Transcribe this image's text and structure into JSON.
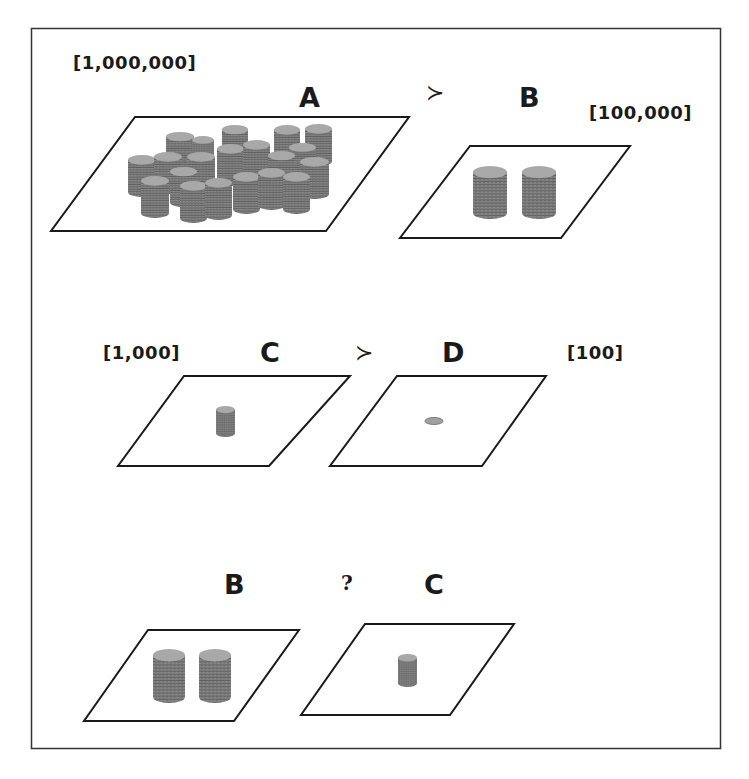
{
  "figure": {
    "frame": {
      "x": 31,
      "y": 28,
      "width": 689,
      "height": 720,
      "stroke": "#333333"
    },
    "colors": {
      "line": "#1a1a1a",
      "coin_side": "#7a7a7a",
      "coin_top": "#a6a6a6",
      "coin_ridge": "#5e5e5e",
      "background": "#ffffff"
    },
    "rows": [
      {
        "id": "row-1",
        "relation": "≻",
        "left": {
          "label": "A",
          "amount": "[1,000,000]",
          "coin_stacks": 22
        },
        "right": {
          "label": "B",
          "amount": "[100,000]",
          "coin_stacks": 2
        }
      },
      {
        "id": "row-2",
        "relation": "≻",
        "left": {
          "label": "C",
          "amount": "[1,000]",
          "coin_stacks": 1
        },
        "right": {
          "label": "D",
          "amount": "[100]",
          "coin_stacks": 0,
          "single_coin": true
        }
      },
      {
        "id": "row-3",
        "relation": "?",
        "left": {
          "label": "B",
          "amount": "",
          "coin_stacks": 2
        },
        "right": {
          "label": "C",
          "amount": "",
          "coin_stacks": 1
        }
      }
    ]
  }
}
